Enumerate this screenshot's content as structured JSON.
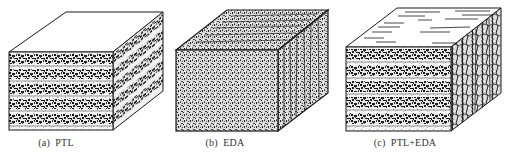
{
  "figure": {
    "panels": [
      {
        "id": "a",
        "caption": "(a)  PTL",
        "caption_x": 56,
        "structure": "layered",
        "description": "Cube with horizontal alternating layers of dense speckled and light bands; plain white top face"
      },
      {
        "id": "b",
        "caption": "(b)  EDA",
        "caption_x": 225,
        "structure": "uniform-speckled",
        "description": "Cube with uniformly speckled gray texture on all faces; dark vertical streaks on right side and horizontal streaks on top"
      },
      {
        "id": "c",
        "caption": "(c)  PTL+EDA",
        "caption_x": 405,
        "structure": "layered-with-cracks",
        "description": "Cube with horizontal layered front face, top face with scattered horizontal dashes, and right side with dense vertical crack network"
      }
    ],
    "colors": {
      "outline": "#1a1a1a",
      "dark_speckle": "#222222",
      "light_band": "#f2f2f2",
      "gray_speckle": "#8a8a8a",
      "background": "#ffffff"
    }
  }
}
